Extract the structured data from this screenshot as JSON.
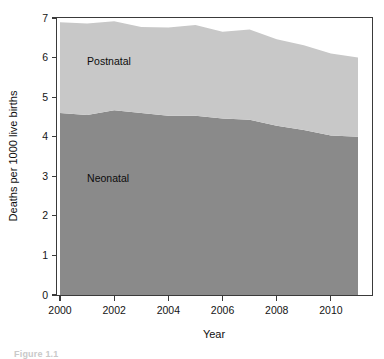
{
  "figure": {
    "caption": "Figure 1.1"
  },
  "chart_data": {
    "type": "area",
    "stacked": true,
    "title": "",
    "xlabel": "Year",
    "ylabel": "Deaths per 1000 live births",
    "x": [
      2000,
      2001,
      2002,
      2003,
      2004,
      2005,
      2006,
      2007,
      2008,
      2009,
      2010,
      2011
    ],
    "xlim": [
      2000,
      2011
    ],
    "ylim": [
      0,
      7
    ],
    "xticks": [
      2000,
      2002,
      2004,
      2006,
      2008,
      2010
    ],
    "xtick_labels": [
      "2000",
      "2002",
      "2004",
      "2006",
      "2008",
      "2010"
    ],
    "yticks": [
      0,
      1,
      2,
      3,
      4,
      5,
      6,
      7
    ],
    "ytick_labels": [
      "0",
      "1",
      "2",
      "3",
      "4",
      "5",
      "6",
      "7"
    ],
    "grid": false,
    "legend_position": "inline-annotation",
    "series": [
      {
        "name": "Neonatal",
        "color": "#8a8a8a",
        "label_x": 2001.0,
        "label_y": 2.85,
        "values": [
          4.6,
          4.55,
          4.67,
          4.6,
          4.53,
          4.53,
          4.46,
          4.43,
          4.28,
          4.17,
          4.03,
          4.0
        ]
      },
      {
        "name": "Postnatal",
        "color": "#c8c8c8",
        "label_x": 2001.0,
        "label_y": 5.8,
        "values": [
          2.29,
          2.31,
          2.25,
          2.17,
          2.23,
          2.29,
          2.19,
          2.28,
          2.18,
          2.14,
          2.07,
          2.0
        ]
      }
    ],
    "totals": [
      6.89,
      6.86,
      6.92,
      6.77,
      6.76,
      6.82,
      6.65,
      6.71,
      6.46,
      6.31,
      6.1,
      6.0
    ]
  },
  "colors": {
    "postnatal": "#c8c8c8",
    "neonatal": "#8a8a8a",
    "axis": "#3a3a3a",
    "text": "#141414",
    "background": "#ffffff"
  }
}
